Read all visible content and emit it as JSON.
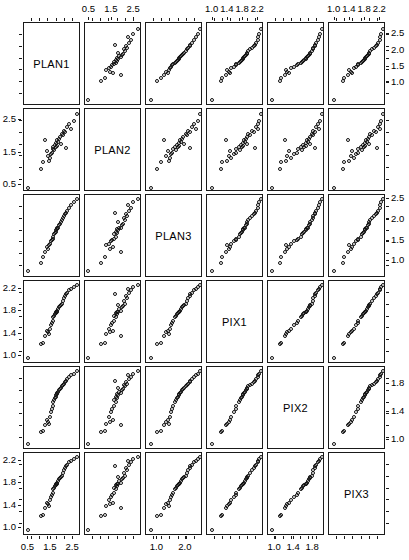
{
  "figure": {
    "type": "scatterplot-matrix",
    "variables": [
      "PLAN1",
      "PLAN2",
      "PLAN3",
      "PIX1",
      "PIX2",
      "PIX3"
    ],
    "n_rows": 6,
    "n_cols": 6,
    "point_marker": "open-circle",
    "frame_color": "#1a1a1a"
  },
  "diagonal_labels": [
    {
      "index": 0,
      "label": "PLAN1"
    },
    {
      "index": 1,
      "label": "PLAN2"
    },
    {
      "index": 2,
      "label": "PLAN3"
    },
    {
      "index": 3,
      "label": "PIX1"
    },
    {
      "index": 4,
      "label": "PIX2"
    },
    {
      "index": 5,
      "label": "PIX3"
    }
  ],
  "axes": {
    "col_top": [
      {
        "col": 1,
        "ticks": [
          "0.5",
          "1.5",
          "2.5"
        ],
        "values": [
          0.5,
          1.5,
          2.5
        ]
      },
      {
        "col": 3,
        "ticks": [
          "1.0",
          "1.4",
          "1.8",
          "2.2"
        ],
        "values": [
          1.0,
          1.4,
          1.8,
          2.2
        ]
      },
      {
        "col": 5,
        "ticks": [
          "1.0",
          "1.4",
          "1.8",
          "2.2"
        ],
        "values": [
          1.0,
          1.4,
          1.8,
          2.2
        ]
      }
    ],
    "col_bottom": [
      {
        "col": 0,
        "ticks": [
          "0.5",
          "1.5",
          "2.5"
        ],
        "values": [
          0.5,
          1.5,
          2.5
        ]
      },
      {
        "col": 2,
        "ticks": [
          "1.0",
          "2.0"
        ],
        "values": [
          1.0,
          2.0
        ]
      },
      {
        "col": 4,
        "ticks": [
          "1.0",
          "1.4",
          "1.8"
        ],
        "values": [
          1.0,
          1.4,
          1.8
        ]
      }
    ],
    "row_right": [
      {
        "row": 0,
        "ticks": [
          "2.5",
          "2.0",
          "1.5",
          "1.0"
        ],
        "values": [
          2.5,
          2.0,
          1.5,
          1.0
        ]
      },
      {
        "row": 2,
        "ticks": [
          "2.5",
          "2.0",
          "1.5",
          "1.0"
        ],
        "values": [
          2.5,
          2.0,
          1.5,
          1.0
        ]
      },
      {
        "row": 4,
        "ticks": [
          "1.8",
          "1.4",
          "1.0"
        ],
        "values": [
          1.8,
          1.4,
          1.0
        ]
      }
    ],
    "row_left": [
      {
        "row": 1,
        "ticks": [
          "2.5",
          "1.5",
          "0.5"
        ],
        "values": [
          2.5,
          1.5,
          0.5
        ]
      },
      {
        "row": 3,
        "ticks": [
          "2.2",
          "1.8",
          "1.4",
          "1.0"
        ],
        "values": [
          2.2,
          1.8,
          1.4,
          1.0
        ]
      },
      {
        "row": 5,
        "ticks": [
          "2.2",
          "1.8",
          "1.4",
          "1.0"
        ],
        "values": [
          2.2,
          1.8,
          1.4,
          1.0
        ]
      }
    ]
  },
  "chart_data": {
    "type": "scatter",
    "title": "",
    "xlabel": "",
    "ylabel": "",
    "grid": false,
    "legend": null,
    "variables": [
      "PLAN1",
      "PLAN2",
      "PLAN3",
      "PIX1",
      "PIX2",
      "PIX3"
    ],
    "ranges": {
      "PLAN1": [
        0.3,
        2.85
      ],
      "PLAN2": [
        0.3,
        2.85
      ],
      "PLAN3": [
        0.6,
        2.6
      ],
      "PIX1": [
        0.85,
        2.35
      ],
      "PIX2": [
        0.85,
        2.05
      ],
      "PIX3": [
        0.85,
        2.35
      ]
    },
    "observations": [
      {
        "PLAN1": 0.45,
        "PLAN2": 0.4,
        "PLAN3": 0.75,
        "PIX1": 0.95,
        "PIX2": 0.92,
        "PIX3": 0.95
      },
      {
        "PLAN1": 1.05,
        "PLAN2": 1.0,
        "PLAN3": 0.95,
        "PIX1": 1.2,
        "PIX2": 1.1,
        "PIX3": 1.2
      },
      {
        "PLAN1": 1.15,
        "PLAN2": 1.2,
        "PLAN3": 1.1,
        "PIX1": 1.22,
        "PIX2": 1.12,
        "PIX3": 1.22
      },
      {
        "PLAN1": 1.3,
        "PLAN2": 1.55,
        "PLAN3": 1.35,
        "PIX1": 1.45,
        "PIX2": 1.28,
        "PIX3": 1.45
      },
      {
        "PLAN1": 1.35,
        "PLAN2": 1.4,
        "PLAN3": 1.3,
        "PIX1": 1.42,
        "PIX2": 1.25,
        "PIX3": 1.42
      },
      {
        "PLAN1": 1.45,
        "PLAN2": 1.35,
        "PLAN3": 1.42,
        "PIX1": 1.48,
        "PIX2": 1.32,
        "PIX3": 1.5
      },
      {
        "PLAN1": 1.5,
        "PLAN2": 1.45,
        "PLAN3": 1.48,
        "PIX1": 1.55,
        "PIX2": 1.4,
        "PIX3": 1.55
      },
      {
        "PLAN1": 1.55,
        "PLAN2": 1.5,
        "PLAN3": 1.52,
        "PIX1": 1.6,
        "PIX2": 1.45,
        "PIX3": 1.6
      },
      {
        "PLAN1": 1.58,
        "PLAN2": 1.62,
        "PLAN3": 1.55,
        "PIX1": 1.62,
        "PIX2": 1.48,
        "PIX3": 1.62
      },
      {
        "PLAN1": 1.62,
        "PLAN2": 1.7,
        "PLAN3": 1.6,
        "PIX1": 1.7,
        "PIX2": 1.55,
        "PIX3": 1.7
      },
      {
        "PLAN1": 1.65,
        "PLAN2": 1.58,
        "PLAN3": 1.65,
        "PIX1": 1.72,
        "PIX2": 1.58,
        "PIX3": 1.72
      },
      {
        "PLAN1": 1.7,
        "PLAN2": 1.75,
        "PLAN3": 1.68,
        "PIX1": 1.75,
        "PIX2": 1.6,
        "PIX3": 1.75
      },
      {
        "PLAN1": 1.72,
        "PLAN2": 1.68,
        "PLAN3": 1.72,
        "PIX1": 1.78,
        "PIX2": 1.62,
        "PIX3": 1.78
      },
      {
        "PLAN1": 1.75,
        "PLAN2": 1.8,
        "PLAN3": 1.75,
        "PIX1": 1.8,
        "PIX2": 1.65,
        "PIX3": 1.8
      },
      {
        "PLAN1": 1.78,
        "PLAN2": 1.72,
        "PLAN3": 1.78,
        "PIX1": 1.8,
        "PIX2": 1.66,
        "PIX3": 1.8
      },
      {
        "PLAN1": 1.8,
        "PLAN2": 1.9,
        "PLAN3": 1.8,
        "PIX1": 1.82,
        "PIX2": 1.68,
        "PIX3": 1.82
      },
      {
        "PLAN1": 1.85,
        "PLAN2": 1.85,
        "PLAN3": 1.82,
        "PIX1": 1.85,
        "PIX2": 1.7,
        "PIX3": 1.85
      },
      {
        "PLAN1": 1.88,
        "PLAN2": 1.95,
        "PLAN3": 1.88,
        "PIX1": 1.88,
        "PIX2": 1.72,
        "PIX3": 1.88
      },
      {
        "PLAN1": 1.92,
        "PLAN2": 2.0,
        "PLAN3": 1.92,
        "PIX1": 1.9,
        "PIX2": 1.74,
        "PIX3": 1.9
      },
      {
        "PLAN1": 1.95,
        "PLAN2": 1.78,
        "PLAN3": 1.95,
        "PIX1": 1.92,
        "PIX2": 1.75,
        "PIX3": 1.92
      },
      {
        "PLAN1": 2.0,
        "PLAN2": 2.1,
        "PLAN3": 2.0,
        "PIX1": 1.95,
        "PIX2": 1.78,
        "PIX3": 1.95
      },
      {
        "PLAN1": 2.05,
        "PLAN2": 2.05,
        "PLAN3": 2.05,
        "PIX1": 2.0,
        "PIX2": 1.8,
        "PIX3": 2.0
      },
      {
        "PLAN1": 2.1,
        "PLAN2": 2.2,
        "PLAN3": 2.1,
        "PIX1": 2.05,
        "PIX2": 1.82,
        "PIX3": 2.05
      },
      {
        "PLAN1": 2.15,
        "PLAN2": 2.15,
        "PLAN3": 2.15,
        "PIX1": 2.1,
        "PIX2": 1.85,
        "PIX3": 2.1
      },
      {
        "PLAN1": 2.25,
        "PLAN2": 2.3,
        "PLAN3": 2.22,
        "PIX1": 2.15,
        "PIX2": 1.88,
        "PIX3": 2.15
      },
      {
        "PLAN1": 2.35,
        "PLAN2": 2.4,
        "PLAN3": 2.3,
        "PIX1": 2.2,
        "PIX2": 1.92,
        "PIX3": 2.2
      },
      {
        "PLAN1": 2.45,
        "PLAN2": 2.25,
        "PLAN3": 2.38,
        "PIX1": 2.22,
        "PIX2": 1.94,
        "PIX3": 2.22
      },
      {
        "PLAN1": 2.55,
        "PLAN2": 2.5,
        "PLAN3": 2.45,
        "PIX1": 2.25,
        "PIX2": 1.96,
        "PIX3": 2.25
      },
      {
        "PLAN1": 2.7,
        "PLAN2": 2.72,
        "PLAN3": 2.52,
        "PIX1": 2.3,
        "PIX2": 2.0,
        "PIX3": 2.3
      },
      {
        "PLAN1": 1.4,
        "PLAN2": 1.25,
        "PLAN3": 1.4,
        "PIX1": 1.38,
        "PIX2": 1.22,
        "PIX3": 1.38
      },
      {
        "PLAN1": 1.25,
        "PLAN2": 1.9,
        "PLAN3": 1.22,
        "PIX1": 1.35,
        "PIX2": 1.2,
        "PIX3": 1.35
      },
      {
        "PLAN1": 2.2,
        "PLAN2": 1.65,
        "PLAN3": 2.18,
        "PIX1": 2.12,
        "PIX2": 1.86,
        "PIX3": 2.12
      }
    ]
  }
}
